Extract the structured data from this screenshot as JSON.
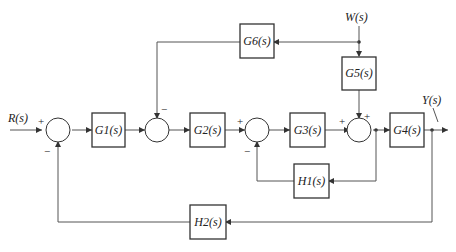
{
  "diagram": {
    "type": "control-system-block-diagram",
    "signals": {
      "input": "R(s)",
      "output": "Y(s)",
      "disturbance": "W(s)"
    },
    "blocks": {
      "g1": "G1(s)",
      "g2": "G2(s)",
      "g3": "G3(s)",
      "g4": "G4(s)",
      "g5": "G5(s)",
      "g6": "G6(s)",
      "h1": "H1(s)",
      "h2": "H2(s)"
    },
    "signs": {
      "sj1_in": "+",
      "sj1_fb": "−",
      "sj2_fb": "−",
      "sj3_in": "+",
      "sj3_fb": "−",
      "sj4_in": "+",
      "sj4_top": "+"
    }
  }
}
